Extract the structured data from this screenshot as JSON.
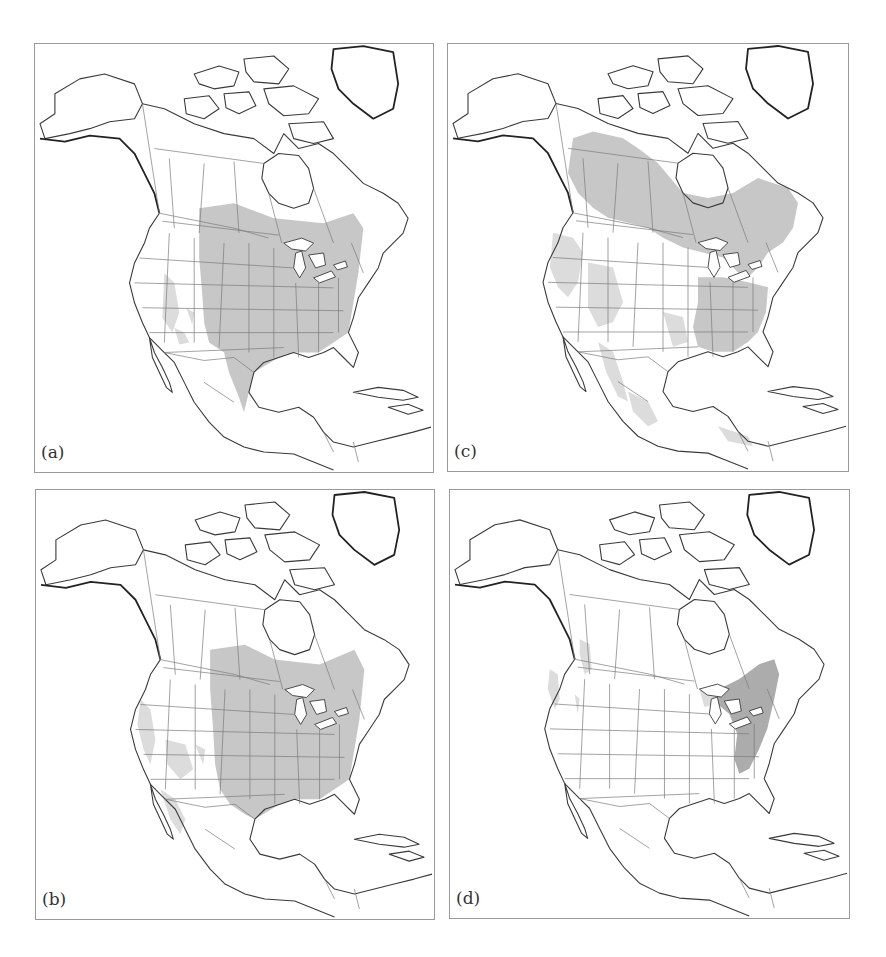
{
  "figure": {
    "panels": [
      {
        "id": "a",
        "label": "(a)",
        "position": "top-left",
        "shaded_regions": [
          "central-eastern-us",
          "southern-canada-prairie-east",
          "south-texas-northeast-mexico",
          "scattered-southwest"
        ]
      },
      {
        "id": "c",
        "label": "(c)",
        "position": "top-right",
        "shaded_regions": [
          "boreal-canada",
          "pacific-northwest",
          "southeastern-us",
          "northeastern-us",
          "mexico-sierras",
          "scattered-western-us",
          "central-america"
        ]
      },
      {
        "id": "b",
        "label": "(b)",
        "position": "bottom-left",
        "shaded_regions": [
          "central-eastern-us",
          "great-lakes-southern-ontario",
          "california-coast",
          "scattered-southwest",
          "northwest-mexico"
        ]
      },
      {
        "id": "d",
        "label": "(d)",
        "position": "bottom-right",
        "shaded_regions": [
          "northeastern-us-appalachians",
          "great-lakes",
          "pacific-northwest-coast",
          "northern-rockies"
        ]
      }
    ],
    "colors": {
      "shade": "#bdbdbd",
      "outline": "#3a3a3a",
      "border": "#7a7a7a",
      "background": "#ffffff"
    }
  }
}
